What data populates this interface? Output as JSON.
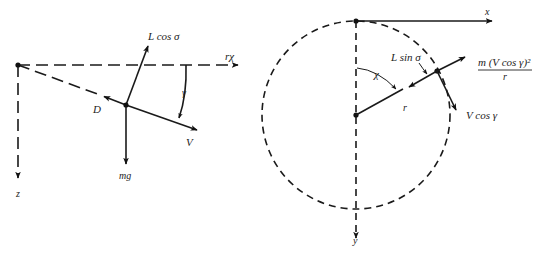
{
  "figure": {
    "left_panel": {
      "description": "Vertical-plane force diagram",
      "labels": {
        "downrange_axis": "rχ",
        "vertical_axis": "z",
        "lift": "L cos σ",
        "drag": "D",
        "velocity": "V",
        "weight": "mg",
        "flight_path_angle": "γ"
      }
    },
    "right_panel": {
      "description": "Horizontal-plane force diagram",
      "labels": {
        "x_axis": "x",
        "y_axis": "y",
        "heading_angle": "χ",
        "radius": "r",
        "side_lift": "L sin σ",
        "horizontal_velocity": "V cos γ",
        "centrifugal_numerator": "m (V cos γ)²",
        "centrifugal_denominator": "r"
      }
    }
  }
}
